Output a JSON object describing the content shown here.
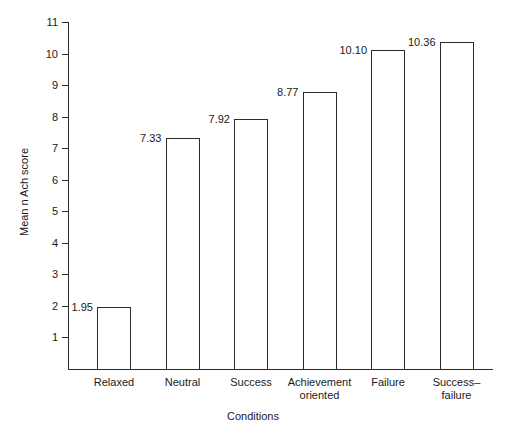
{
  "chart_data": {
    "type": "bar",
    "title": "",
    "subtitle": "",
    "xlabel": "Conditions",
    "ylabel": "Mean n Ach score",
    "categories": [
      "Relaxed",
      "Neutral",
      "Success",
      "Achievement\noriented",
      "Failure",
      "Success–\nfailure"
    ],
    "values": [
      1.95,
      7.33,
      7.92,
      8.77,
      10.1,
      10.36
    ],
    "value_labels": [
      "1.95",
      "7.33",
      "7.92",
      "8.77",
      "10.10",
      "10.36"
    ],
    "ylim": [
      0,
      11
    ],
    "yticks": [
      1,
      2,
      3,
      4,
      5,
      6,
      7,
      8,
      9,
      10,
      11
    ],
    "ytick_labels": [
      "1",
      "2",
      "3",
      "4",
      "5",
      "6",
      "7",
      "8",
      "9",
      "10",
      "11"
    ],
    "grid": false,
    "legend": null,
    "legend_position": "none",
    "bar_style": "outline",
    "bar_fill_color": "#ffffff",
    "bar_edge_color": "#2b2b2b",
    "axis_color": "#2b2b2b",
    "text_color": "#1a1a1a",
    "background_color": "#ffffff"
  }
}
